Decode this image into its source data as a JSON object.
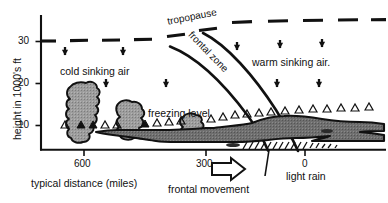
{
  "figure": {
    "type": "meteorological-cross-section"
  },
  "axes": {
    "y": {
      "title": "height in 1000's ft",
      "ticks": [
        "10",
        "20",
        "30"
      ],
      "tick_values": [
        10,
        20,
        30
      ],
      "min": 0,
      "max": 34,
      "units": "1000's ft"
    },
    "x": {
      "title": "typical distance (miles)",
      "ticks": [
        "600",
        "300",
        "0"
      ],
      "tick_values": [
        600,
        300,
        0
      ],
      "units": "miles",
      "direction": "decreasing left to right"
    }
  },
  "labels": {
    "tropopause": "tropopause",
    "frontal_zone": "frontal zone",
    "cold_sinking_air": "cold sinking air",
    "warm_sinking_air": "warm sinking air.",
    "freezing_level": "freezing level",
    "light_rain": "light rain",
    "frontal_movement": "frontal movement"
  },
  "colors": {
    "ink": "#111111",
    "cloud_light": "#9a9a9a",
    "cloud_dark": "#6e6e6e",
    "background": "#ffffff"
  },
  "elements": {
    "downward_arrow_count": 9,
    "freezing_level_marker": "open-triangle-row",
    "precipitation": "hatched-light-rain",
    "movement_arrow_direction": "right"
  }
}
